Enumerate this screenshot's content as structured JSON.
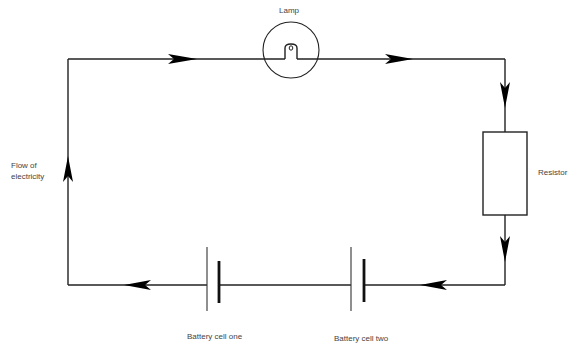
{
  "diagram": {
    "colors": {
      "wire": "#222222",
      "arrow": "#000000",
      "text": "#444444",
      "background": "#ffffff"
    },
    "labels": {
      "lamp": "Lamp",
      "flow_line1": "Flow of",
      "flow_line2": "electricity",
      "resistor": "Resistor",
      "battery_one": "Battery cell one",
      "battery_two": "Battery cell two"
    },
    "components": [
      {
        "id": "lamp",
        "type": "lamp",
        "label": "Lamp"
      },
      {
        "id": "resistor",
        "type": "resistor",
        "label": "Resistor"
      },
      {
        "id": "battery_one",
        "type": "battery-cell",
        "label": "Battery cell one"
      },
      {
        "id": "battery_two",
        "type": "battery-cell",
        "label": "Battery cell two"
      }
    ],
    "flow_direction": "clockwise",
    "arrows": [
      {
        "position": "top-left",
        "direction": "right"
      },
      {
        "position": "top-right",
        "direction": "right"
      },
      {
        "position": "right-upper",
        "direction": "down"
      },
      {
        "position": "right-lower",
        "direction": "down"
      },
      {
        "position": "bottom-right",
        "direction": "left"
      },
      {
        "position": "bottom-left",
        "direction": "left"
      },
      {
        "position": "left",
        "direction": "up"
      }
    ]
  }
}
